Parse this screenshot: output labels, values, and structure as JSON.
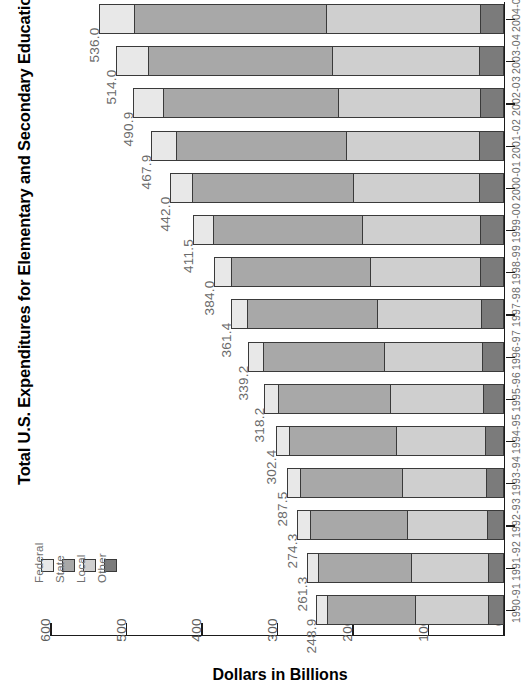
{
  "chart_data": {
    "type": "bar",
    "subtype": "stacked-horizontal",
    "title": "Total U.S. Expenditures for Elementary and Secondary Education",
    "xlabel": "Dollars in Billions",
    "ylabel": "",
    "orientation": "horizontal-rotated-90",
    "grid": false,
    "axis_reversed": true,
    "xlim": [
      0,
      600
    ],
    "xticks": [
      "600",
      "500",
      "400",
      "300",
      "200",
      "100",
      "0"
    ],
    "legend_position": "left-middle",
    "legend": [
      {
        "label": "Federal",
        "color": "#e8e8e8"
      },
      {
        "label": "State",
        "color": "#a8a8a8"
      },
      {
        "label": "Local",
        "color": "#cfcfcf"
      },
      {
        "label": "Other",
        "color": "#7b7b7b"
      }
    ],
    "categories": [
      "2004-05",
      "2003-04",
      "2002-03",
      "2001-02",
      "2000-01",
      "1999-00",
      "1998-99",
      "1997-98",
      "1996-97",
      "1995-96",
      "1994-95",
      "1993-94",
      "1992-93",
      "1991-92",
      "1990-91"
    ],
    "totals": [
      "536.0",
      "514.0",
      "490.9",
      "467.9",
      "442.0",
      "411.5",
      "384.0",
      "361.4",
      "339.2",
      "318.2",
      "302.4",
      "287.5",
      "274.3",
      "261.3",
      "248.9"
    ],
    "series": [
      {
        "name": "Federal",
        "values": [
          46.5,
          43.0,
          39.0,
          33.5,
          29.0,
          25.5,
          23.0,
          21.5,
          20.0,
          19.0,
          18.0,
          17.5,
          17.0,
          15.5,
          14.5
        ]
      },
      {
        "name": "State",
        "values": [
          254.0,
          243.5,
          232.5,
          224.5,
          213.0,
          198.0,
          183.0,
          171.5,
          160.0,
          148.5,
          141.5,
          134.5,
          128.5,
          123.0,
          117.0
        ]
      },
      {
        "name": "Local",
        "values": [
          203.5,
          195.0,
          187.0,
          176.5,
          166.5,
          156.0,
          146.0,
          138.0,
          130.0,
          123.5,
          117.5,
          111.5,
          106.0,
          101.0,
          96.0
        ]
      },
      {
        "name": "Other",
        "values": [
          32.0,
          32.5,
          32.4,
          33.4,
          33.5,
          32.0,
          32.0,
          30.4,
          29.2,
          27.2,
          25.4,
          24.0,
          22.8,
          21.8,
          21.4
        ]
      }
    ]
  }
}
